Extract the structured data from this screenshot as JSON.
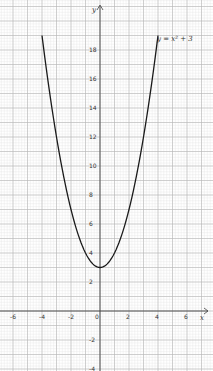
{
  "chart_data": {
    "type": "line",
    "title": "",
    "xlabel": "x",
    "ylabel": "y",
    "series": [
      {
        "name": "y = x² + 3",
        "x": [
          -4,
          -3.5,
          -3,
          -2.5,
          -2,
          -1.5,
          -1,
          -0.5,
          0,
          0.5,
          1,
          1.5,
          2,
          2.5,
          3,
          3.5,
          4
        ],
        "values": [
          19,
          15.25,
          12,
          9.25,
          7,
          5.25,
          4,
          3.25,
          3,
          3.25,
          4,
          5.25,
          7,
          9.25,
          12,
          15.25,
          19
        ]
      }
    ],
    "annotation": "y = x² + 3",
    "x_ticks": [
      "-6",
      "-4",
      "-2",
      "0",
      "2",
      "4",
      "6"
    ],
    "y_ticks": [
      "18",
      "16",
      "14",
      "12",
      "10",
      "8",
      "6",
      "4",
      "2",
      "-2",
      "-4"
    ],
    "xlim": [
      -6.9,
      7.8
    ],
    "ylim": [
      -4.1,
      21.4
    ],
    "grid": true,
    "grid_style": "graph paper"
  },
  "labels": {
    "x_axis": "x",
    "y_axis": "y",
    "curve": "y = x² + 3"
  }
}
